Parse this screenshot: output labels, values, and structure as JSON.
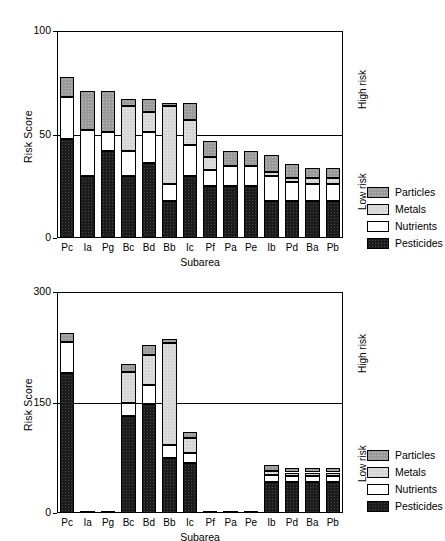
{
  "figure": {
    "categories_label": "Subarea",
    "y_label": "Risk Score",
    "risk_high": "High risk",
    "risk_low": "Low risk",
    "legend": [
      {
        "key": "particles",
        "label": "Particles",
        "color": "#9a9a9a"
      },
      {
        "key": "metals",
        "label": "Metals",
        "color": "#d6d6d6"
      },
      {
        "key": "nutrients",
        "label": "Nutrients",
        "color": "#ffffff"
      },
      {
        "key": "pesticides",
        "label": "Pesticides",
        "color": "#1c1c1c"
      }
    ]
  },
  "chart_data": [
    {
      "id": "top",
      "type": "bar",
      "stacked": true,
      "title": "",
      "xlabel": "Subarea",
      "ylabel": "Risk Score",
      "ylim": [
        0,
        100
      ],
      "yticks": [
        0,
        50,
        100
      ],
      "ytick_labels": [
        "0",
        "50",
        "100"
      ],
      "grid": false,
      "threshold": {
        "value": 50,
        "label_above": "High risk",
        "label_below": "Low risk"
      },
      "legend_position": "right",
      "categories": [
        "Pc",
        "Ia",
        "Pg",
        "Bc",
        "Bd",
        "Bb",
        "Ic",
        "Pf",
        "Pa",
        "Pe",
        "Ib",
        "Pd",
        "Ba",
        "Pb"
      ],
      "series": [
        {
          "name": "Pesticides",
          "values": [
            48,
            30,
            42,
            30,
            36,
            18,
            30,
            25,
            25,
            25,
            18,
            18,
            18,
            18
          ]
        },
        {
          "name": "Nutrients",
          "values": [
            20,
            22,
            9,
            12,
            15,
            8,
            15,
            8,
            10,
            10,
            12,
            9,
            8,
            8
          ]
        },
        {
          "name": "Metals",
          "values": [
            0,
            0,
            0,
            22,
            10,
            38,
            12,
            6,
            0,
            0,
            2,
            2,
            3,
            3
          ]
        },
        {
          "name": "Particles",
          "values": [
            10,
            19,
            20,
            3,
            6,
            1,
            8,
            8,
            7,
            7,
            8,
            7,
            5,
            5
          ]
        }
      ],
      "totals": [
        78,
        71,
        71,
        67,
        67,
        65,
        65,
        47,
        42,
        42,
        40,
        36,
        34,
        34
      ]
    },
    {
      "id": "bottom",
      "type": "bar",
      "stacked": true,
      "title": "",
      "xlabel": "Subarea",
      "ylabel": "Risk Score",
      "ylim": [
        0,
        300
      ],
      "yticks": [
        0,
        150,
        300
      ],
      "ytick_labels": [
        "0",
        "150",
        "300"
      ],
      "grid": false,
      "threshold": {
        "value": 150,
        "label_above": "High risk",
        "label_below": "Low risk"
      },
      "legend_position": "right",
      "categories": [
        "Pc",
        "Ia",
        "Pg",
        "Bc",
        "Bd",
        "Bb",
        "Ic",
        "Pf",
        "Pa",
        "Pe",
        "Ib",
        "Pd",
        "Ba",
        "Pb"
      ],
      "series": [
        {
          "name": "Pesticides",
          "values": [
            190,
            2,
            2,
            132,
            148,
            75,
            68,
            2,
            2,
            2,
            42,
            42,
            42,
            42
          ]
        },
        {
          "name": "Nutrients",
          "values": [
            42,
            0,
            0,
            18,
            26,
            18,
            14,
            0,
            0,
            0,
            9,
            8,
            8,
            8
          ]
        },
        {
          "name": "Metals",
          "values": [
            0,
            0,
            0,
            42,
            40,
            138,
            20,
            0,
            0,
            0,
            6,
            5,
            5,
            5
          ]
        },
        {
          "name": "Particles",
          "values": [
            12,
            0,
            0,
            10,
            14,
            5,
            8,
            0,
            0,
            0,
            8,
            6,
            6,
            6
          ]
        }
      ],
      "totals": [
        244,
        2,
        2,
        202,
        228,
        236,
        110,
        2,
        2,
        2,
        65,
        61,
        61,
        61
      ]
    }
  ]
}
